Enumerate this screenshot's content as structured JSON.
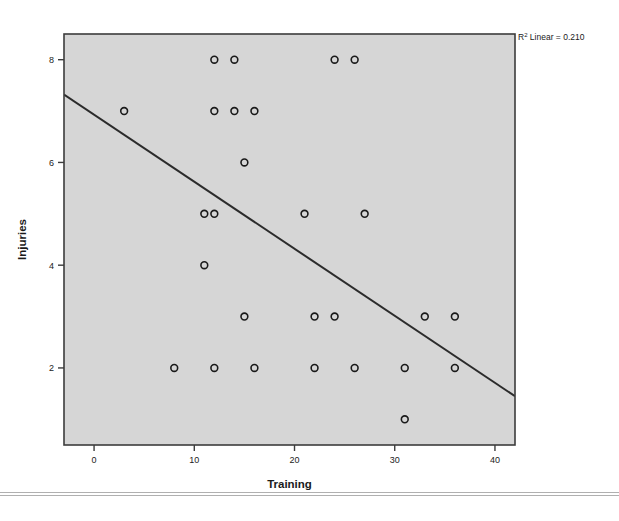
{
  "figure": {
    "background_color": "#ffffff",
    "plot_area_color": "#d6d6d6",
    "frame_color": "#3c3c3c",
    "marker_color": "#1a1a1a",
    "fit_line_color": "#2b2b2b"
  },
  "annotation": {
    "r_squared_prefix": "R",
    "r_squared_sup": "2",
    "r_squared_text": " Linear = 0.210"
  },
  "chart_data": {
    "type": "scatter",
    "title": "",
    "xlabel": "Training",
    "ylabel": "Injuries",
    "xlim": [
      -3,
      42
    ],
    "ylim": [
      0.5,
      8.5
    ],
    "xticks": [
      0,
      10,
      20,
      30,
      40
    ],
    "xtick_labels": [
      "0",
      "10",
      "20",
      "30",
      "40"
    ],
    "yticks": [
      2,
      4,
      6,
      8
    ],
    "ytick_labels": [
      "2",
      "4",
      "6",
      "8"
    ],
    "grid": false,
    "legend": "none",
    "points": [
      {
        "x": 3,
        "y": 7
      },
      {
        "x": 12,
        "y": 8
      },
      {
        "x": 14,
        "y": 8
      },
      {
        "x": 24,
        "y": 8
      },
      {
        "x": 26,
        "y": 8
      },
      {
        "x": 12,
        "y": 7
      },
      {
        "x": 14,
        "y": 7
      },
      {
        "x": 16,
        "y": 7
      },
      {
        "x": 15,
        "y": 6
      },
      {
        "x": 11,
        "y": 5
      },
      {
        "x": 12,
        "y": 5
      },
      {
        "x": 21,
        "y": 5
      },
      {
        "x": 27,
        "y": 5
      },
      {
        "x": 11,
        "y": 4
      },
      {
        "x": 15,
        "y": 3
      },
      {
        "x": 22,
        "y": 3
      },
      {
        "x": 24,
        "y": 3
      },
      {
        "x": 33,
        "y": 3
      },
      {
        "x": 36,
        "y": 3
      },
      {
        "x": 8,
        "y": 2
      },
      {
        "x": 12,
        "y": 2
      },
      {
        "x": 16,
        "y": 2
      },
      {
        "x": 22,
        "y": 2
      },
      {
        "x": 26,
        "y": 2
      },
      {
        "x": 31,
        "y": 2
      },
      {
        "x": 36,
        "y": 2
      },
      {
        "x": 31,
        "y": 1
      }
    ],
    "fit_line": {
      "type": "linear",
      "r_squared": 0.21,
      "x_start": -3,
      "y_start": 7.32,
      "x_end": 42,
      "y_end": 1.45
    }
  }
}
